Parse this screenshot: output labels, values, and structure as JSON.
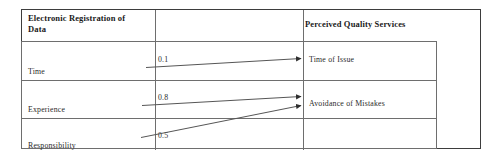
{
  "figure": {
    "type": "path-diagram-table",
    "header": {
      "left_title": "Electronic Registration of Data",
      "left_title_line1": "Electronic Registration of",
      "left_title_line2": "Data",
      "right_title": "Perceived Quality Services"
    },
    "predictors": [
      {
        "id": "time",
        "label": "Time"
      },
      {
        "id": "experience",
        "label": "Experience"
      },
      {
        "id": "responsibility",
        "label": "Responsibility"
      }
    ],
    "outcomes": [
      {
        "id": "time-of-issue",
        "label": "Time of Issue"
      },
      {
        "id": "avoidance-of-mistakes",
        "label": "Avoidance of Mistakes"
      }
    ],
    "paths": [
      {
        "id": "path-time-timeofissue",
        "from": "Time",
        "to": "Time of Issue",
        "coefficient": "0.1"
      },
      {
        "id": "path-experience-avoidance",
        "from": "Experience",
        "to": "Avoidance of Mistakes",
        "coefficient": "0.8"
      },
      {
        "id": "path-responsibility-avoidance",
        "from": "Responsibility",
        "to": "Avoidance of Mistakes",
        "coefficient": "0.5"
      }
    ],
    "colors": {
      "outer_border": "#3d3d3d",
      "grid_border": "#6e6e6e",
      "text": "#2a2a2a",
      "heading_text": "#1a1a1a",
      "arrow": "#555555",
      "background": "#ffffff"
    }
  }
}
